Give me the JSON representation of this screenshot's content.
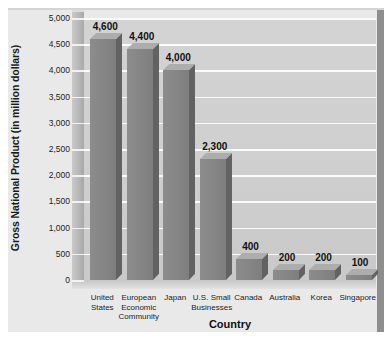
{
  "chart_data": {
    "type": "bar",
    "title": "",
    "xlabel": "Country",
    "ylabel": "Gross National Product (in million dollars)",
    "ylim": [
      0,
      5000
    ],
    "ytick_step": 500,
    "ytick_labels": [
      "5,000",
      "4,500",
      "4,000",
      "3,500",
      "3,000",
      "2,500",
      "2,000",
      "1,500",
      "1,000",
      "500",
      "0"
    ],
    "grid": true,
    "legend": "none",
    "style": "3d-bar",
    "categories": [
      "United\nStates",
      "European\nEconomic\nCommunity",
      "Japan",
      "U.S. Small\nBusinesses",
      "Canada",
      "Australia",
      "Korea",
      "Singapore"
    ],
    "values": [
      4600,
      4400,
      4000,
      2300,
      400,
      200,
      200,
      100
    ],
    "value_labels": [
      "4,600",
      "4,400",
      "4,000",
      "2,300",
      "400",
      "200",
      "200",
      "100"
    ],
    "colors": {
      "bar_front": "#858585",
      "bar_top": "#adadad",
      "bar_side": "#626262",
      "plot_background": "#cfcfcf",
      "gridline": "#fbfbfb",
      "outer_background": "#e9e9e9",
      "side_wall": "#8e8e8e",
      "text": "#111111"
    }
  }
}
